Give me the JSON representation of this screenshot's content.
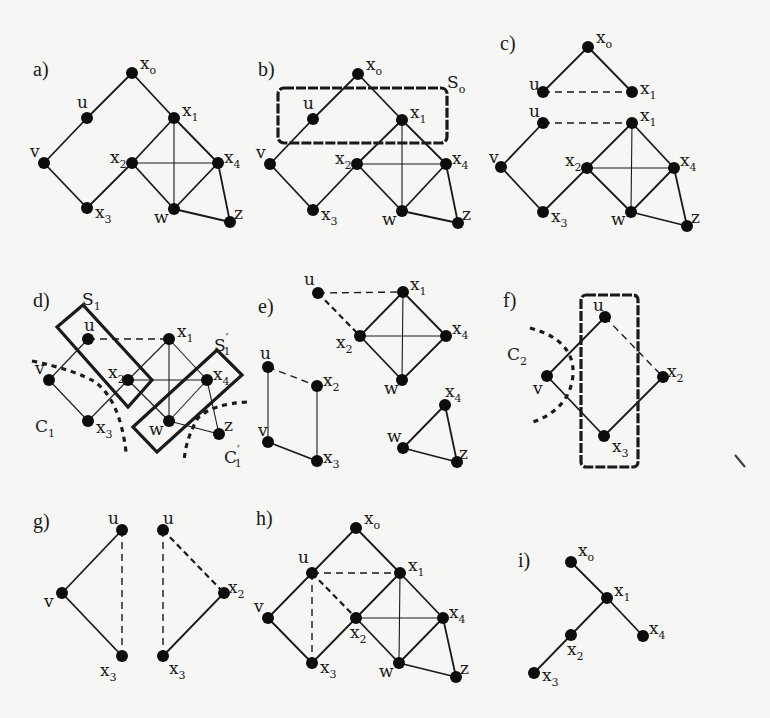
{
  "figure": {
    "panels": [
      {
        "id": "a",
        "label": "a)"
      },
      {
        "id": "b",
        "label": "b)",
        "sets": [
          {
            "id": "S0",
            "name": "S",
            "sub": "o"
          }
        ]
      },
      {
        "id": "c",
        "label": "c)"
      },
      {
        "id": "d",
        "label": "d)",
        "sets": [
          {
            "id": "S1",
            "name": "S",
            "sub": "1"
          },
          {
            "id": "S1p",
            "name": "S",
            "sub": "1",
            "prime": true
          }
        ],
        "cuts": [
          {
            "id": "C1",
            "name": "C",
            "sub": "1"
          },
          {
            "id": "C1p",
            "name": "C",
            "sub": "1",
            "prime": true
          }
        ]
      },
      {
        "id": "e",
        "label": "e)"
      },
      {
        "id": "f",
        "label": "f)",
        "cuts": [
          {
            "id": "C2",
            "name": "C",
            "sub": "2"
          }
        ]
      },
      {
        "id": "g",
        "label": "g)"
      },
      {
        "id": "h",
        "label": "h)"
      },
      {
        "id": "i",
        "label": "i)"
      }
    ],
    "node_labels": {
      "x0": {
        "base": "x",
        "sub": "o"
      },
      "x1": {
        "base": "x",
        "sub": "1"
      },
      "x2": {
        "base": "x",
        "sub": "2"
      },
      "x3": {
        "base": "x",
        "sub": "3"
      },
      "x4": {
        "base": "x",
        "sub": "4"
      },
      "u": {
        "base": "u",
        "sub": ""
      },
      "v": {
        "base": "v",
        "sub": ""
      },
      "w": {
        "base": "w",
        "sub": ""
      },
      "z": {
        "base": "z",
        "sub": ""
      }
    },
    "graphs": {
      "a": {
        "nodes": [
          "x0",
          "u",
          "x1",
          "v",
          "x2",
          "x4",
          "x3",
          "w",
          "z"
        ],
        "edges": [
          [
            "x0",
            "u",
            "solid"
          ],
          [
            "x0",
            "x1",
            "solid"
          ],
          [
            "u",
            "v",
            "solid"
          ],
          [
            "v",
            "x3",
            "solid"
          ],
          [
            "x3",
            "x2",
            "solid"
          ],
          [
            "x2",
            "x1",
            "solid"
          ],
          [
            "x1",
            "x4",
            "solid"
          ],
          [
            "x2",
            "x4",
            "thin"
          ],
          [
            "x1",
            "w",
            "thin"
          ],
          [
            "x2",
            "w",
            "solid"
          ],
          [
            "x4",
            "w",
            "solid"
          ],
          [
            "w",
            "z",
            "solid"
          ],
          [
            "x4",
            "z",
            "solid"
          ]
        ]
      },
      "b": {
        "nodes": [
          "x0",
          "u",
          "x1",
          "v",
          "x2",
          "x4",
          "x3",
          "w",
          "z"
        ],
        "edges": [
          [
            "x0",
            "u",
            "solid"
          ],
          [
            "x0",
            "x1",
            "solid"
          ],
          [
            "u",
            "v",
            "solid"
          ],
          [
            "v",
            "x3",
            "solid"
          ],
          [
            "x3",
            "x2",
            "solid"
          ],
          [
            "x2",
            "x1",
            "solid"
          ],
          [
            "x1",
            "x4",
            "solid"
          ],
          [
            "x2",
            "x4",
            "thin"
          ],
          [
            "x1",
            "w",
            "thin"
          ],
          [
            "x2",
            "w",
            "solid"
          ],
          [
            "x4",
            "w",
            "solid"
          ],
          [
            "w",
            "z",
            "solid"
          ],
          [
            "x4",
            "z",
            "solid"
          ]
        ]
      },
      "c": {
        "nodes": [
          "x0",
          "uT",
          "x1T",
          "uB",
          "x1B",
          "v",
          "x2",
          "x4",
          "x3",
          "w",
          "z"
        ],
        "edges": [
          [
            "x0",
            "uT",
            "solid"
          ],
          [
            "x0",
            "x1T",
            "solid"
          ],
          [
            "uT",
            "x1T",
            "dashed"
          ],
          [
            "uB",
            "x1B",
            "dashed"
          ],
          [
            "uB",
            "v",
            "solid"
          ],
          [
            "v",
            "x3",
            "solid"
          ],
          [
            "x3",
            "x2",
            "solid"
          ],
          [
            "x2",
            "x1B",
            "solid"
          ],
          [
            "x1B",
            "x4",
            "solid"
          ],
          [
            "x2",
            "x4",
            "thin"
          ],
          [
            "x1B",
            "w",
            "thin"
          ],
          [
            "x2",
            "w",
            "solid"
          ],
          [
            "x4",
            "w",
            "solid"
          ],
          [
            "w",
            "z",
            "solid"
          ],
          [
            "x4",
            "z",
            "solid"
          ]
        ]
      },
      "d": {
        "nodes": [
          "u",
          "x1",
          "v",
          "x2",
          "x4",
          "x3",
          "w",
          "z"
        ],
        "edges": [
          [
            "u",
            "x1",
            "dashed"
          ],
          [
            "u",
            "v",
            "thin"
          ],
          [
            "v",
            "x3",
            "thin"
          ],
          [
            "x3",
            "x2",
            "thin"
          ],
          [
            "x2",
            "x1",
            "thin"
          ],
          [
            "x1",
            "x4",
            "thin"
          ],
          [
            "x2",
            "x4",
            "thin"
          ],
          [
            "x1",
            "w",
            "thin"
          ],
          [
            "x2",
            "w",
            "thin"
          ],
          [
            "x4",
            "w",
            "thin"
          ],
          [
            "w",
            "z",
            "thin"
          ],
          [
            "x4",
            "z",
            "thin"
          ]
        ]
      },
      "e": {
        "nodes": [
          "u",
          "x1",
          "x2",
          "x4",
          "w",
          "u2",
          "x2b",
          "v",
          "x3",
          "x4b",
          "wb",
          "z"
        ],
        "edges": [
          [
            "u",
            "x1",
            "dashed"
          ],
          [
            "u",
            "x2",
            "dashed-bold"
          ],
          [
            "x2",
            "x1",
            "solid"
          ],
          [
            "x1",
            "x4",
            "solid"
          ],
          [
            "x2",
            "x4",
            "thin"
          ],
          [
            "x1",
            "w",
            "thin"
          ],
          [
            "x2",
            "w",
            "solid"
          ],
          [
            "x4",
            "w",
            "solid"
          ],
          [
            "u2",
            "x2b",
            "dashed"
          ],
          [
            "u2",
            "v",
            "thin"
          ],
          [
            "x2b",
            "x3",
            "thin"
          ],
          [
            "v",
            "x3",
            "solid"
          ],
          [
            "x4b",
            "wb",
            "solid"
          ],
          [
            "wb",
            "z",
            "solid"
          ],
          [
            "x4b",
            "z",
            "solid"
          ]
        ]
      },
      "f": {
        "nodes": [
          "u",
          "v",
          "x2",
          "x3"
        ],
        "edges": [
          [
            "u",
            "v",
            "solid"
          ],
          [
            "u",
            "x2",
            "dashed"
          ],
          [
            "v",
            "x3",
            "solid"
          ],
          [
            "x3",
            "x2",
            "solid"
          ]
        ]
      },
      "g": {
        "nodes": [
          "uL",
          "v",
          "x3L",
          "uR",
          "x2",
          "x3R"
        ],
        "edges": [
          [
            "uL",
            "v",
            "solid"
          ],
          [
            "v",
            "x3L",
            "solid"
          ],
          [
            "uL",
            "x3L",
            "dashed"
          ],
          [
            "uR",
            "x3R",
            "dashed"
          ],
          [
            "uR",
            "x2",
            "dashed-bold"
          ],
          [
            "x2",
            "x3R",
            "solid"
          ]
        ]
      },
      "h": {
        "nodes": [
          "x0",
          "u",
          "x1",
          "v",
          "x2",
          "x4",
          "x3",
          "w",
          "z"
        ],
        "edges": [
          [
            "x0",
            "u",
            "solid"
          ],
          [
            "x0",
            "x1",
            "solid"
          ],
          [
            "u",
            "v",
            "solid"
          ],
          [
            "v",
            "x3",
            "solid"
          ],
          [
            "x3",
            "x2",
            "solid"
          ],
          [
            "x2",
            "x1",
            "solid"
          ],
          [
            "x1",
            "x4",
            "solid"
          ],
          [
            "x2",
            "x4",
            "thin"
          ],
          [
            "x1",
            "w",
            "thin"
          ],
          [
            "x2",
            "w",
            "solid"
          ],
          [
            "x4",
            "w",
            "solid"
          ],
          [
            "w",
            "z",
            "solid"
          ],
          [
            "x4",
            "z",
            "solid"
          ],
          [
            "u",
            "x1",
            "dashed"
          ],
          [
            "u",
            "x2",
            "dashed-bold"
          ],
          [
            "u",
            "x3",
            "dashed"
          ]
        ]
      },
      "i": {
        "nodes": [
          "x0",
          "x1",
          "x4",
          "x2",
          "x3"
        ],
        "edges": [
          [
            "x0",
            "x1",
            "solid"
          ],
          [
            "x1",
            "x4",
            "solid"
          ],
          [
            "x1",
            "x2",
            "solid"
          ],
          [
            "x2",
            "x3",
            "solid"
          ]
        ]
      }
    }
  }
}
